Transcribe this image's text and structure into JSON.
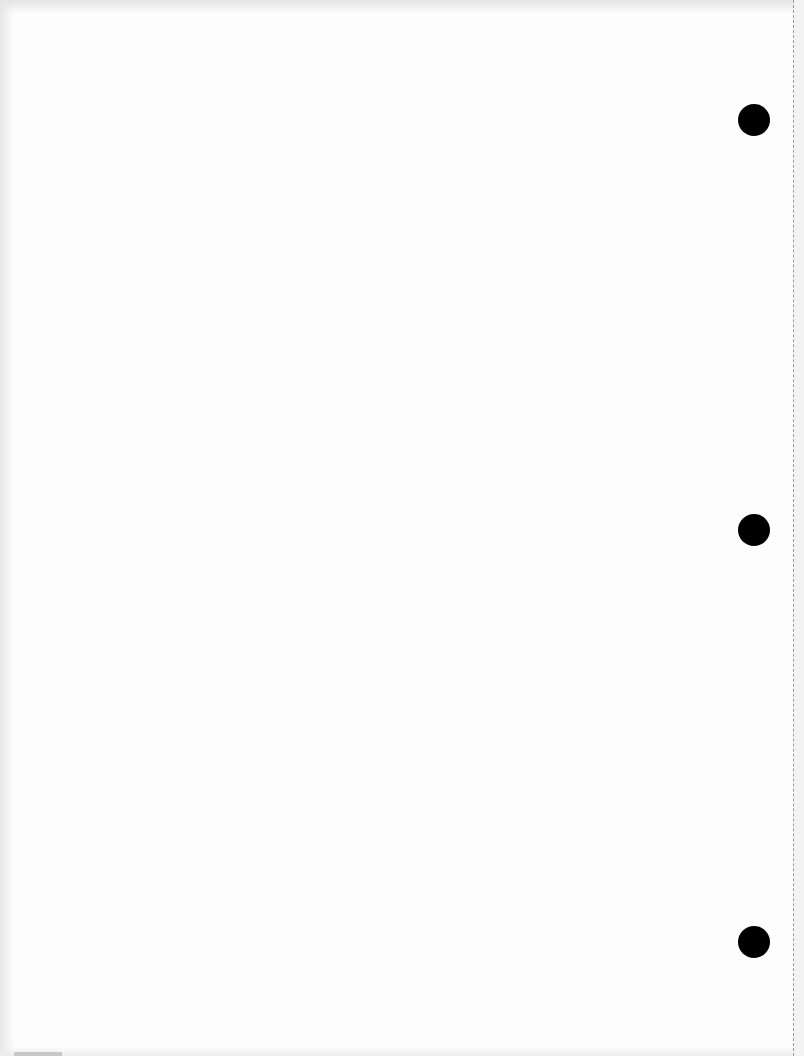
{
  "document": {
    "type": "blank-page",
    "text": "",
    "background_color": "#fdfdfd",
    "punch_holes": [
      {
        "x": 754,
        "y": 120
      },
      {
        "x": 754,
        "y": 530
      },
      {
        "x": 754,
        "y": 942
      }
    ],
    "hole_color": "#000000",
    "perforation": {
      "side": "right",
      "style": "dashed"
    }
  }
}
